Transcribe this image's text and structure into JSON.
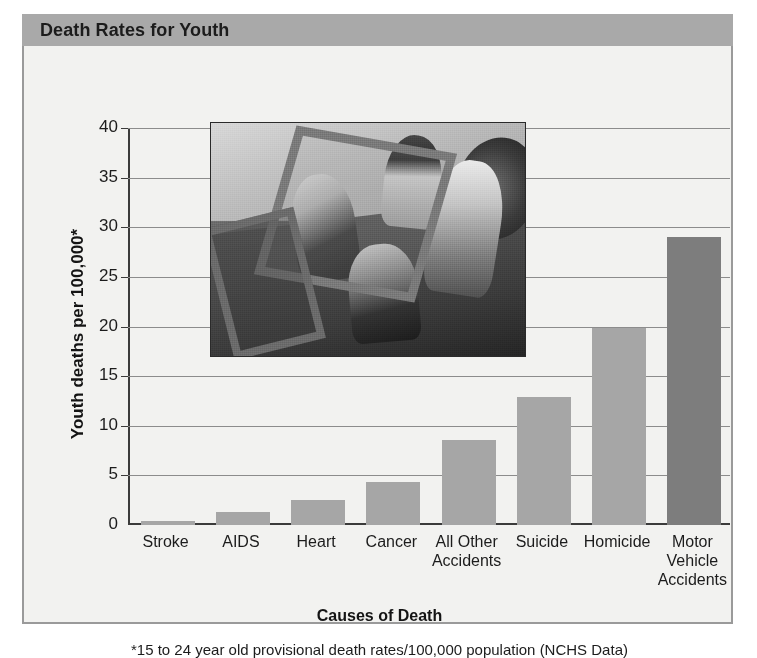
{
  "header": {
    "title": "Death Rates for Youth"
  },
  "axis": {
    "y_title": "Youth deaths per 100,000*",
    "x_title": "Causes of Death",
    "y_ticks": [
      "40",
      "35",
      "30",
      "25",
      "20",
      "15",
      "10",
      "5",
      "0"
    ]
  },
  "footnote": "*15 to 24 year old provisional death rates/100,000 population (NCHS Data)",
  "photo": {
    "alt_name": "teens-in-convertible-photo"
  },
  "colors": {
    "titlebar": "#a9a9a9",
    "panel": "#f2f2f0",
    "bar": "#a6a6a6",
    "bar_highlight": "#7d7d7d",
    "grid": "#8c8c8c",
    "axis": "#3b3b3b",
    "text": "#1c1c1c"
  },
  "chart_data": {
    "type": "bar",
    "title": "Death Rates for Youth",
    "xlabel": "Causes of Death",
    "ylabel": "Youth deaths per 100,000*",
    "ylim": [
      0,
      40
    ],
    "ytick_step": 5,
    "grid": true,
    "legend": false,
    "categories": [
      "Stroke",
      "AIDS",
      "Heart",
      "Cancer",
      "All Other Accidents",
      "Suicide",
      "Homicide",
      "Motor Vehicle Accidents"
    ],
    "category_lines": [
      [
        "Stroke"
      ],
      [
        "AIDS"
      ],
      [
        "Heart"
      ],
      [
        "Cancer"
      ],
      [
        "All Other",
        "Accidents"
      ],
      [
        "Suicide"
      ],
      [
        "Homicide"
      ],
      [
        "Motor",
        "Vehicle",
        "Accidents"
      ]
    ],
    "values": [
      0.4,
      1.3,
      2.5,
      4.3,
      8.6,
      12.9,
      19.9,
      29.0
    ],
    "highlight_index": 7,
    "annotation": "*15 to 24 year old provisional death rates/100,000 population (NCHS Data)"
  }
}
